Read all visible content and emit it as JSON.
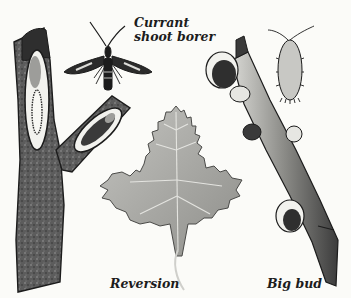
{
  "labels": {
    "borer_line1": "Currant",
    "borer_line2": "shoot borer",
    "reversion": "Reversion",
    "big_bud": "Big bud"
  },
  "colors": {
    "background": "#fbfbf8",
    "ink": "#1c1c1c",
    "bark_dark": "#3a3a3a",
    "bark_mid": "#6a6a6a",
    "leaf": "#a9a9a6",
    "leaf_vein": "#e2e2de",
    "mite": "#c8c8c4",
    "tunnel": "#9d9d9a"
  }
}
